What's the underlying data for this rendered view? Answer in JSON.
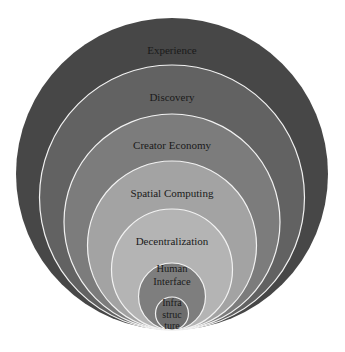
{
  "diagram": {
    "type": "nested-concentric-layers",
    "layers": [
      {
        "label": "Experience",
        "lines": [
          "Experience"
        ],
        "fill": "#474747"
      },
      {
        "label": "Discovery",
        "lines": [
          "Discovery"
        ],
        "fill": "#626262"
      },
      {
        "label": "Creator Economy",
        "lines": [
          "Creator Economy"
        ],
        "fill": "#7c7c7c"
      },
      {
        "label": "Spatial Computing",
        "lines": [
          "Spatial Computing"
        ],
        "fill": "#a3a3a3"
      },
      {
        "label": "Decentralization",
        "lines": [
          "Decentralization"
        ],
        "fill": "#b4b4b4"
      },
      {
        "label": "Human Interface",
        "lines": [
          "Human",
          "Interface"
        ],
        "fill": "#7e7e7e"
      },
      {
        "label": "Infrastructure",
        "lines": [
          "Infra",
          "struc",
          "ture"
        ],
        "fill": "#6e6e6e"
      }
    ],
    "stroke": "#f2f2f2"
  }
}
